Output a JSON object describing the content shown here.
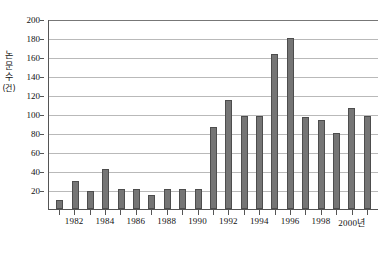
{
  "chart_data": {
    "type": "bar",
    "title": "",
    "xlabel": "연도",
    "ylabel": "논문 수 (건)",
    "ylabel_chars": [
      "논",
      "문",
      "수",
      "(건)"
    ],
    "ylim": [
      0,
      200
    ],
    "ytick_step": 20,
    "yticks": [
      200,
      180,
      160,
      140,
      120,
      100,
      80,
      60,
      40,
      20
    ],
    "grid": true,
    "legend": "none",
    "xtick_suffix": "년",
    "categories": [
      "1981",
      "1982",
      "1983",
      "1984",
      "1985",
      "1986",
      "1987",
      "1988",
      "1989",
      "1990",
      "1991",
      "1992",
      "1993",
      "1994",
      "1995",
      "1996",
      "1997",
      "1998",
      "1999",
      "2000",
      "2001"
    ],
    "xtick_labels": [
      "1982",
      "1984",
      "1986",
      "1988",
      "1990",
      "1992",
      "1994",
      "1996",
      "1998",
      "2000년"
    ],
    "xtick_categories": [
      "1982",
      "1984",
      "1986",
      "1988",
      "1990",
      "1992",
      "1994",
      "1996",
      "1998",
      "2000"
    ],
    "values": [
      10,
      29,
      19,
      42,
      21,
      21,
      15,
      21,
      21,
      21,
      86,
      115,
      98,
      98,
      163,
      180,
      97,
      94,
      80,
      106,
      98
    ],
    "bar_color": "#757575",
    "bar_border_color": "#4d4d4d",
    "grid_color": "#b9b9b9",
    "axis_color": "#555555",
    "background": "#ffffff"
  }
}
